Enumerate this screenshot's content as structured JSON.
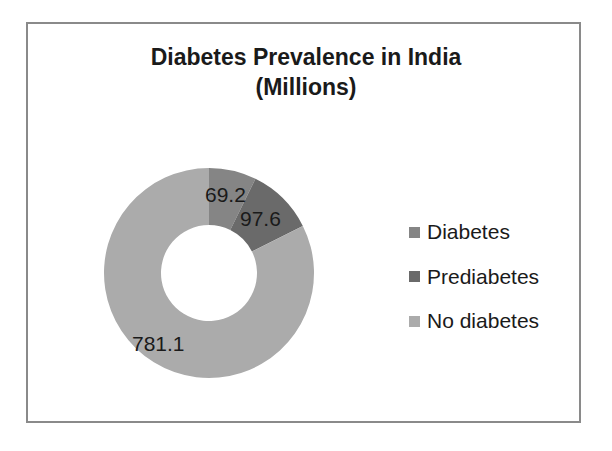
{
  "chart": {
    "title_line1": "Diabetes Prevalence in India",
    "title_line2": "(Millions)"
  },
  "legend": {
    "items": [
      {
        "label": "Diabetes",
        "color": "#858585"
      },
      {
        "label": "Prediabetes",
        "color": "#6a6a6a"
      },
      {
        "label": "No diabetes",
        "color": "#ababab"
      }
    ]
  },
  "labels": {
    "diabetes": "69.2",
    "prediabetes": "97.6",
    "no_diabetes": "781.1"
  },
  "chart_data": {
    "type": "pie",
    "subtype": "doughnut",
    "title": "Diabetes Prevalence in India (Millions)",
    "categories": [
      "Diabetes",
      "Prediabetes",
      "No diabetes"
    ],
    "values": [
      69.2,
      97.6,
      781.1
    ],
    "units": "Millions",
    "colors": [
      "#858585",
      "#6a6a6a",
      "#ababab"
    ],
    "start_angle_deg": 0,
    "direction": "clockwise",
    "data_labels": [
      "69.2",
      "97.6",
      "781.1"
    ],
    "legend_position": "right",
    "grid": false
  }
}
